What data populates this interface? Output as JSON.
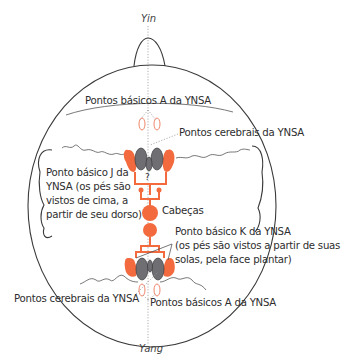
{
  "diagram": {
    "labels": {
      "yin": "Yin",
      "yang": "Yang",
      "basic_a_top": "Pontos básicos A da YNSA",
      "cerebral_top": "Pontos cerebrais da YNSA",
      "basic_j_line1": "Ponto básico J da",
      "basic_j_line2": "YNSA (os pés são",
      "basic_j_line3": "vistos de cima, a",
      "basic_j_line4": "partir de seu dorso)",
      "heads": "Cabeças",
      "basic_k_line1": "Ponto básico K da YNSA",
      "basic_k_line2": "(os pés são vistos a partir de suas",
      "basic_k_line3": "solas, pela face plantar)",
      "cerebral_bottom": "Pontos cerebrais da YNSA",
      "basic_a_bottom": "Pontos básicos A da YNSA"
    },
    "colors": {
      "accent_orange": "#f26a3d",
      "brain_grey": "#6f6f73",
      "outline": "#3a3a3a"
    }
  }
}
